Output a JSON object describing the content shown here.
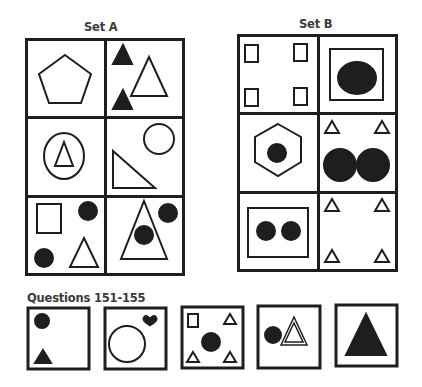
{
  "set_a": {
    "title": "Set A",
    "cells": [
      {
        "position": "row1-col1",
        "contents": [
          "outline pentagon"
        ]
      },
      {
        "position": "row1-col2",
        "contents": [
          "2 small filled triangles",
          "large outline triangle"
        ]
      },
      {
        "position": "row2-col1",
        "contents": [
          "outline ellipse containing outline triangle"
        ]
      },
      {
        "position": "row2-col2",
        "contents": [
          "outline circle",
          "outline right triangle"
        ]
      },
      {
        "position": "row3-col1",
        "contents": [
          "outline square",
          "2 filled circles",
          "outline triangle"
        ]
      },
      {
        "position": "row3-col2",
        "contents": [
          "large outline triangle containing filled circle",
          "filled circle"
        ]
      }
    ]
  },
  "set_b": {
    "title": "Set B",
    "cells": [
      {
        "position": "row1-col1",
        "contents": [
          "4 small outline rectangles in corners"
        ]
      },
      {
        "position": "row1-col2",
        "contents": [
          "outline square containing filled ellipse"
        ]
      },
      {
        "position": "row2-col1",
        "contents": [
          "outline hexagon containing filled circle"
        ]
      },
      {
        "position": "row2-col2",
        "contents": [
          "2 small outline triangles",
          "2 large filled circles"
        ]
      },
      {
        "position": "row3-col1",
        "contents": [
          "outline rectangle containing 2 filled circles"
        ]
      },
      {
        "position": "row3-col2",
        "contents": [
          "4 small outline triangles in corners"
        ]
      }
    ]
  },
  "questions": {
    "title": "Questions 151-155",
    "items": [
      {
        "number": 151,
        "contents": [
          "filled circle",
          "small filled triangle"
        ]
      },
      {
        "number": 152,
        "contents": [
          "large outline circle",
          "small filled heart"
        ]
      },
      {
        "number": 153,
        "contents": [
          "small outline rectangle",
          "3 small outline triangles",
          "filled circle"
        ]
      },
      {
        "number": 154,
        "contents": [
          "filled circle",
          "double-outline triangle"
        ]
      },
      {
        "number": 155,
        "contents": [
          "large filled triangle"
        ]
      }
    ]
  },
  "colors": {
    "ink": "#1e1e1e",
    "heading": "#3a3a3a",
    "background": "#ffffff"
  }
}
